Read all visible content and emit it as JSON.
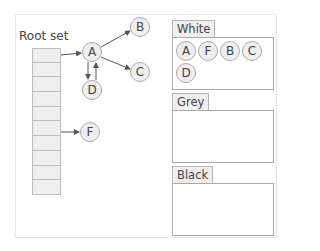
{
  "diagram": {
    "root_set": {
      "title": "Root set",
      "cell_count": 10
    },
    "nodes": [
      {
        "id": "A",
        "label": "A",
        "x": 92,
        "y": 52
      },
      {
        "id": "B",
        "label": "B",
        "x": 140,
        "y": 27
      },
      {
        "id": "C",
        "label": "C",
        "x": 140,
        "y": 72
      },
      {
        "id": "D",
        "label": "D",
        "x": 92,
        "y": 90
      },
      {
        "id": "F",
        "label": "F",
        "x": 90,
        "y": 132
      }
    ],
    "edges": [
      {
        "from": "root-0",
        "to": "A"
      },
      {
        "from": "root-6",
        "to": "F"
      },
      {
        "from": "A",
        "to": "B"
      },
      {
        "from": "A",
        "to": "C"
      },
      {
        "from": "A",
        "to": "D"
      },
      {
        "from": "D",
        "to": "A"
      }
    ],
    "sets": [
      {
        "name": "White",
        "members": [
          "A",
          "F",
          "B",
          "C",
          "D"
        ]
      },
      {
        "name": "Grey",
        "members": []
      },
      {
        "name": "Black",
        "members": []
      }
    ],
    "colors": {
      "node_fill": "#eeeeee",
      "node_stroke": "#aaaaaa",
      "edge": "#555555"
    }
  }
}
